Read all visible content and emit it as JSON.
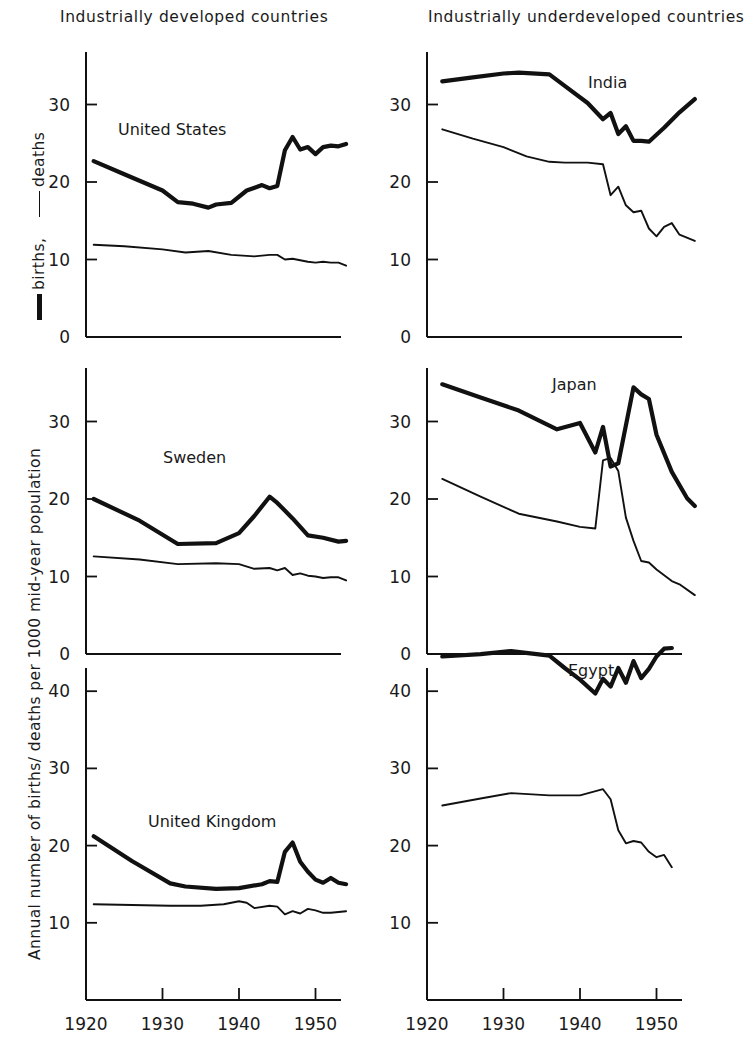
{
  "titles": {
    "left": "Industrially developed countries",
    "right": "Industrially underdeveloped countries"
  },
  "axis_label": "Annual number of births/ deaths per 1000 mid-year population",
  "legend": {
    "births_text": "births,",
    "deaths_text": "deaths",
    "births_style": "thick-rule",
    "deaths_style": "thin-rule"
  },
  "xticks": [
    "1920",
    "1930",
    "1940",
    "1950"
  ],
  "panel_labels": {
    "united_states": "United States",
    "india": "India",
    "sweden": "Sweden",
    "japan": "Japan",
    "united_kingdom": "United Kingdom",
    "egypt": "Egypt"
  },
  "chart_data": [
    {
      "type": "line",
      "title": "United States",
      "panel": "top-left",
      "xlabel": "",
      "ylabel": "Annual number of births/ deaths per 1000 mid-year population",
      "xlim": [
        1918,
        1956
      ],
      "ylim": [
        0,
        36
      ],
      "yticks": [
        0,
        10,
        20,
        30
      ],
      "xticks": [
        1920,
        1930,
        1940,
        1950
      ],
      "grid": false,
      "legend": [
        "births",
        "deaths"
      ],
      "series": [
        {
          "name": "births",
          "style": "thick",
          "x": [
            1921,
            1925,
            1930,
            1932,
            1934,
            1936,
            1937,
            1939,
            1941,
            1943,
            1944,
            1945,
            1946,
            1947,
            1948,
            1949,
            1950,
            1951,
            1952,
            1953,
            1954
          ],
          "values": [
            22.7,
            21.0,
            18.9,
            17.4,
            17.2,
            16.7,
            17.1,
            17.3,
            18.9,
            19.6,
            19.2,
            19.5,
            24.1,
            25.8,
            24.2,
            24.5,
            23.6,
            24.5,
            24.7,
            24.6,
            24.9
          ]
        },
        {
          "name": "deaths",
          "style": "thin",
          "x": [
            1921,
            1925,
            1930,
            1933,
            1936,
            1939,
            1942,
            1944,
            1945,
            1946,
            1947,
            1948,
            1949,
            1950,
            1951,
            1952,
            1953,
            1954
          ],
          "values": [
            11.9,
            11.7,
            11.3,
            10.9,
            11.1,
            10.6,
            10.4,
            10.6,
            10.6,
            10.0,
            10.1,
            9.9,
            9.7,
            9.6,
            9.7,
            9.6,
            9.6,
            9.2
          ]
        }
      ]
    },
    {
      "type": "line",
      "title": "India",
      "panel": "top-right",
      "xlim": [
        1918,
        1956
      ],
      "ylim": [
        0,
        36
      ],
      "yticks": [
        0,
        10,
        20,
        30
      ],
      "xticks": [
        1920,
        1930,
        1940,
        1950
      ],
      "grid": false,
      "legend": [
        "births",
        "deaths"
      ],
      "series": [
        {
          "name": "births",
          "style": "thick",
          "x": [
            1922,
            1926,
            1930,
            1932,
            1936,
            1938,
            1941,
            1943,
            1944,
            1945,
            1946,
            1947,
            1948,
            1949,
            1951,
            1953,
            1955
          ],
          "values": [
            33.0,
            33.5,
            34.0,
            34.1,
            33.9,
            32.4,
            30.2,
            28.1,
            28.9,
            26.2,
            27.2,
            25.3,
            25.3,
            25.2,
            27.0,
            29.0,
            30.7
          ]
        },
        {
          "name": "deaths",
          "style": "thin",
          "x": [
            1922,
            1926,
            1930,
            1933,
            1936,
            1938,
            1941,
            1943,
            1944,
            1945,
            1946,
            1947,
            1948,
            1949,
            1950,
            1951,
            1952,
            1953,
            1955
          ],
          "values": [
            26.8,
            25.6,
            24.5,
            23.3,
            22.6,
            22.5,
            22.5,
            22.3,
            18.3,
            19.4,
            17.0,
            16.1,
            16.3,
            14.0,
            13.0,
            14.2,
            14.7,
            13.2,
            12.4
          ]
        }
      ]
    },
    {
      "type": "line",
      "title": "Sweden",
      "panel": "mid-left",
      "xlim": [
        1918,
        1956
      ],
      "ylim": [
        0,
        36
      ],
      "yticks": [
        0,
        10,
        20,
        30
      ],
      "xticks": [
        1920,
        1930,
        1940,
        1950
      ],
      "grid": false,
      "legend": [
        "births",
        "deaths"
      ],
      "series": [
        {
          "name": "births",
          "style": "thick",
          "x": [
            1921,
            1927,
            1932,
            1937,
            1940,
            1942,
            1944,
            1945,
            1947,
            1949,
            1951,
            1953,
            1954
          ],
          "values": [
            20.0,
            17.2,
            14.2,
            14.3,
            15.6,
            17.8,
            20.3,
            19.5,
            17.5,
            15.3,
            15.0,
            14.5,
            14.6
          ]
        },
        {
          "name": "deaths",
          "style": "thin",
          "x": [
            1921,
            1927,
            1932,
            1937,
            1940,
            1942,
            1944,
            1945,
            1946,
            1947,
            1948,
            1949,
            1950,
            1951,
            1952,
            1953,
            1954
          ],
          "values": [
            12.6,
            12.2,
            11.6,
            11.7,
            11.6,
            11.0,
            11.1,
            10.8,
            11.1,
            10.2,
            10.4,
            10.1,
            10.0,
            9.8,
            9.9,
            9.9,
            9.5
          ]
        }
      ]
    },
    {
      "type": "line",
      "title": "Japan",
      "panel": "mid-right",
      "xlim": [
        1918,
        1956
      ],
      "ylim": [
        0,
        36
      ],
      "yticks": [
        0,
        10,
        20,
        30
      ],
      "xticks": [
        1920,
        1930,
        1940,
        1950
      ],
      "grid": false,
      "legend": [
        "births",
        "deaths"
      ],
      "series": [
        {
          "name": "births",
          "style": "thick",
          "x": [
            1922,
            1927,
            1932,
            1937,
            1940,
            1942,
            1943,
            1944,
            1945,
            1947,
            1948,
            1949,
            1950,
            1952,
            1954,
            1955
          ],
          "values": [
            34.8,
            33.1,
            31.4,
            29.0,
            29.8,
            26.0,
            29.3,
            24.2,
            24.6,
            34.4,
            33.5,
            32.9,
            28.3,
            23.5,
            20.1,
            19.1
          ]
        },
        {
          "name": "deaths",
          "style": "thin",
          "x": [
            1922,
            1927,
            1932,
            1937,
            1940,
            1942,
            1943,
            1944,
            1945,
            1946,
            1947,
            1948,
            1949,
            1950,
            1952,
            1953,
            1955
          ],
          "values": [
            22.6,
            20.3,
            18.1,
            17.1,
            16.4,
            16.2,
            25.0,
            25.3,
            23.6,
            17.6,
            14.6,
            12.0,
            11.8,
            10.9,
            9.4,
            9.0,
            7.6
          ]
        }
      ]
    },
    {
      "type": "line",
      "title": "United Kingdom",
      "panel": "bottom-left",
      "xlim": [
        1918,
        1956
      ],
      "ylim": [
        0,
        46
      ],
      "yticks": [
        10,
        20,
        30,
        40
      ],
      "xticks": [
        1920,
        1930,
        1940,
        1950
      ],
      "grid": false,
      "legend": [
        "births",
        "deaths"
      ],
      "series": [
        {
          "name": "births",
          "style": "thick",
          "x": [
            1921,
            1926,
            1931,
            1933,
            1937,
            1940,
            1943,
            1944,
            1945,
            1946,
            1947,
            1948,
            1949,
            1950,
            1951,
            1952,
            1953,
            1954
          ],
          "values": [
            21.2,
            18.0,
            15.1,
            14.7,
            14.4,
            14.5,
            15.0,
            15.4,
            15.3,
            19.2,
            20.4,
            17.9,
            16.6,
            15.6,
            15.2,
            15.8,
            15.2,
            15.0
          ]
        },
        {
          "name": "deaths",
          "style": "thin",
          "x": [
            1921,
            1926,
            1931,
            1935,
            1938,
            1940,
            1941,
            1942,
            1944,
            1945,
            1946,
            1947,
            1948,
            1949,
            1950,
            1951,
            1952,
            1953,
            1954
          ],
          "values": [
            12.4,
            12.3,
            12.2,
            12.2,
            12.4,
            12.8,
            12.6,
            11.9,
            12.2,
            12.1,
            11.1,
            11.5,
            11.2,
            11.8,
            11.6,
            11.3,
            11.3,
            11.4,
            11.5
          ]
        }
      ]
    },
    {
      "type": "line",
      "title": "Egypt",
      "panel": "bottom-right",
      "xlim": [
        1918,
        1956
      ],
      "ylim": [
        0,
        46
      ],
      "yticks": [
        10,
        20,
        30,
        40
      ],
      "xticks": [
        1920,
        1930,
        1940,
        1950
      ],
      "grid": false,
      "legend": [
        "births",
        "deaths"
      ],
      "series": [
        {
          "name": "births",
          "style": "thick",
          "x": [
            1922,
            1927,
            1931,
            1936,
            1938,
            1940,
            1942,
            1943,
            1944,
            1945,
            1946,
            1947,
            1948,
            1949,
            1950,
            1951,
            1952
          ],
          "values": [
            44.5,
            44.8,
            45.2,
            44.6,
            43.0,
            41.5,
            39.7,
            41.6,
            40.6,
            43.0,
            41.1,
            43.9,
            41.7,
            42.9,
            44.5,
            45.5,
            45.6
          ]
        },
        {
          "name": "deaths",
          "style": "thin",
          "x": [
            1922,
            1927,
            1931,
            1936,
            1940,
            1943,
            1944,
            1945,
            1946,
            1947,
            1948,
            1949,
            1950,
            1951,
            1952
          ],
          "values": [
            25.2,
            26.1,
            26.8,
            26.5,
            26.5,
            27.3,
            26.0,
            22.0,
            20.3,
            20.6,
            20.4,
            19.2,
            18.5,
            18.8,
            17.2
          ]
        }
      ]
    }
  ]
}
